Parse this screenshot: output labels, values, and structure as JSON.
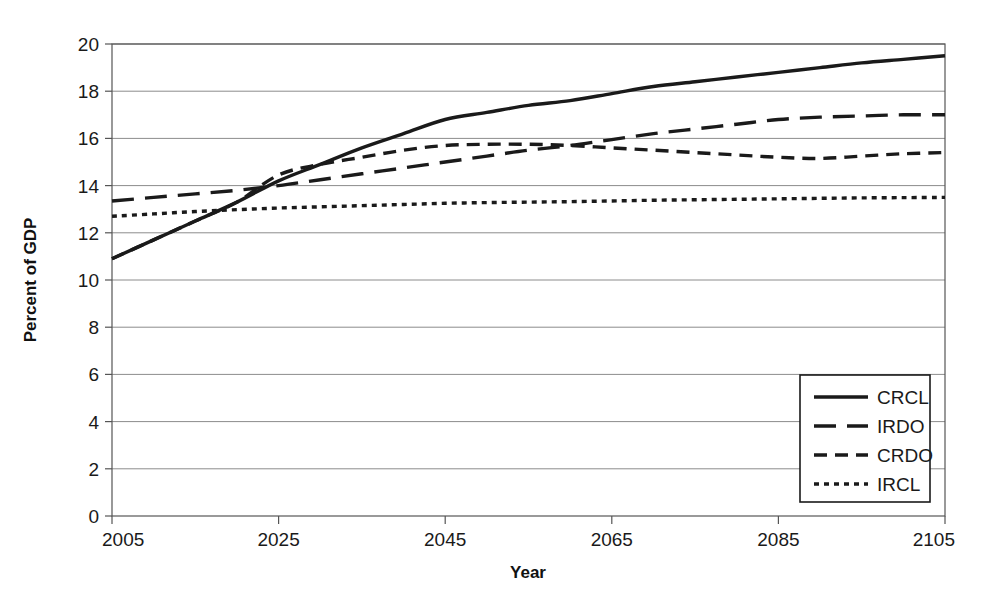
{
  "chart_data": {
    "type": "line",
    "title": "",
    "xlabel": "Year",
    "ylabel": "Percent of GDP",
    "xlim": [
      2005,
      2105
    ],
    "ylim": [
      0,
      20
    ],
    "xticks": [
      2005,
      2025,
      2045,
      2065,
      2085,
      2105
    ],
    "yticks": [
      0,
      2,
      4,
      6,
      8,
      10,
      12,
      14,
      16,
      18,
      20
    ],
    "grid": true,
    "grid_axis": "y",
    "legend_position": "lower right",
    "x": [
      2005,
      2010,
      2015,
      2020,
      2025,
      2030,
      2035,
      2040,
      2045,
      2050,
      2055,
      2060,
      2065,
      2070,
      2075,
      2080,
      2085,
      2090,
      2095,
      2100,
      2105
    ],
    "series": [
      {
        "name": "CRCL",
        "style": "solid",
        "color": "#1a1a1a",
        "values": [
          10.9,
          11.7,
          12.5,
          13.3,
          14.2,
          14.9,
          15.6,
          16.2,
          16.8,
          17.1,
          17.4,
          17.6,
          17.9,
          18.2,
          18.4,
          18.6,
          18.8,
          19.0,
          19.2,
          19.35,
          19.5
        ]
      },
      {
        "name": "IRDO",
        "style": "long-dash",
        "color": "#1a1a1a",
        "values": [
          13.35,
          13.5,
          13.65,
          13.8,
          14.0,
          14.25,
          14.5,
          14.75,
          15.0,
          15.25,
          15.5,
          15.7,
          15.95,
          16.2,
          16.4,
          16.6,
          16.8,
          16.9,
          16.95,
          17.0,
          17.0
        ]
      },
      {
        "name": "CRDO",
        "style": "medium-dash",
        "color": "#1a1a1a",
        "values": [
          10.9,
          11.7,
          12.5,
          13.3,
          14.45,
          14.9,
          15.2,
          15.5,
          15.7,
          15.75,
          15.75,
          15.7,
          15.6,
          15.5,
          15.4,
          15.3,
          15.2,
          15.15,
          15.25,
          15.35,
          15.4
        ]
      },
      {
        "name": "IRCL",
        "style": "dotted",
        "color": "#1a1a1a",
        "values": [
          12.7,
          12.8,
          12.9,
          12.98,
          13.05,
          13.1,
          13.15,
          13.2,
          13.25,
          13.28,
          13.3,
          13.32,
          13.35,
          13.38,
          13.4,
          13.42,
          13.44,
          13.46,
          13.48,
          13.49,
          13.5
        ]
      }
    ]
  },
  "axes": {
    "y_title": "Percent of GDP",
    "x_title": "Year",
    "y_tick_labels": [
      "20",
      "18",
      "16",
      "14",
      "12",
      "10",
      "8",
      "6",
      "4",
      "2",
      "0"
    ],
    "x_tick_labels": [
      "2005",
      "2025",
      "2045",
      "2065",
      "2085",
      "2105"
    ]
  },
  "legend": {
    "entries": [
      {
        "label": "CRCL",
        "style": "solid"
      },
      {
        "label": "IRDO",
        "style": "long-dash"
      },
      {
        "label": "CRDO",
        "style": "medium-dash"
      },
      {
        "label": "IRCL",
        "style": "dotted"
      }
    ]
  },
  "colors": {
    "line": "#1a1a1a",
    "grid": "#8c8c8c",
    "axis": "#555555",
    "background": "#ffffff"
  }
}
